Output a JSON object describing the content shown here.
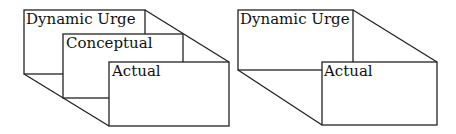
{
  "diagrams": [
    {
      "name": "three-layer",
      "boxes": [
        {
          "label": "Dynamic Urge"
        },
        {
          "label": "Conceptual"
        },
        {
          "label": "Actual"
        }
      ]
    },
    {
      "name": "two-layer",
      "boxes": [
        {
          "label": "Dynamic Urge"
        },
        {
          "label": "Actual"
        }
      ]
    }
  ],
  "colors": {
    "line": "#222222",
    "background": "#ffffff"
  }
}
